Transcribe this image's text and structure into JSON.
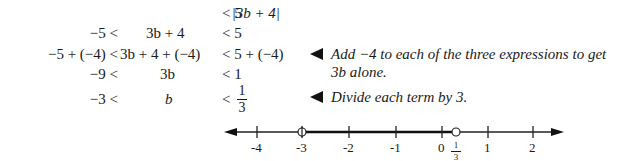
{
  "steps": [
    {
      "left": "",
      "middle": "|3b + 4|",
      "right": "< 5"
    },
    {
      "left": "−5 <",
      "middle": "3b + 4",
      "right": "< 5"
    },
    {
      "left": "−5 + (−4) <",
      "middle": "3b + 4 + (−4)",
      "right": "< 5 + (−4)"
    },
    {
      "left": "−9 <",
      "middle": "3b",
      "right": "< 1"
    },
    {
      "left": "−3 <",
      "middle": "b",
      "right": "<",
      "right_frac": {
        "num": "1",
        "den": "3"
      }
    }
  ],
  "notes": [
    {
      "line1": "Add −4 to each of the three expressions to get",
      "line2": "3b alone."
    },
    {
      "line1": "Divide each term by 3."
    }
  ],
  "number_line": {
    "ticks": [
      "-4",
      "-3",
      "-2",
      "-1",
      "0",
      "1",
      "2"
    ],
    "special_label": {
      "num": "1",
      "den": "3"
    },
    "interval": {
      "from": "-3",
      "to": "1/3",
      "open_left": true,
      "open_right": true
    }
  }
}
